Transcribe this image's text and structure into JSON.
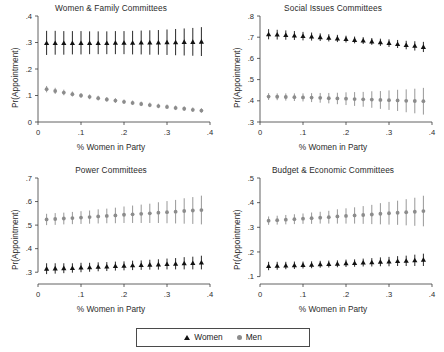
{
  "figure": {
    "legend": {
      "women_label": "Women",
      "men_label": "Men",
      "women_marker": "triangle-marker",
      "men_marker": "circle-marker",
      "women_color": "#111111",
      "men_color": "#8c8c8c"
    }
  },
  "chart_data": [
    {
      "type": "scatter",
      "title": "Women & Family Committees",
      "xlabel": "% Women in Party",
      "ylabel": "Pr(Appointment)",
      "xlim": [
        0,
        0.4
      ],
      "ylim": [
        0,
        0.4
      ],
      "xticks": [
        0,
        0.1,
        0.2,
        0.3,
        0.4
      ],
      "xticklabels": [
        "0",
        ".1",
        ".2",
        ".3",
        ".4"
      ],
      "yticks": [
        0,
        0.1,
        0.2,
        0.3,
        0.4
      ],
      "yticklabels": [
        "0",
        ".1",
        ".2",
        ".3",
        ".4"
      ],
      "grid": false,
      "x": [
        0.02,
        0.04,
        0.06,
        0.08,
        0.1,
        0.12,
        0.14,
        0.16,
        0.18,
        0.2,
        0.22,
        0.24,
        0.26,
        0.28,
        0.3,
        0.32,
        0.34,
        0.36,
        0.38
      ],
      "series": [
        {
          "name": "Women",
          "marker": "triangle",
          "color": "#111111",
          "values": [
            0.298,
            0.298,
            0.298,
            0.298,
            0.298,
            0.298,
            0.298,
            0.298,
            0.299,
            0.299,
            0.299,
            0.3,
            0.3,
            0.3,
            0.301,
            0.301,
            0.302,
            0.302,
            0.303
          ],
          "ci_low": [
            0.253,
            0.254,
            0.254,
            0.255,
            0.255,
            0.256,
            0.256,
            0.256,
            0.256,
            0.256,
            0.255,
            0.255,
            0.254,
            0.254,
            0.253,
            0.252,
            0.251,
            0.25,
            0.249
          ],
          "ci_high": [
            0.344,
            0.344,
            0.343,
            0.343,
            0.343,
            0.342,
            0.342,
            0.342,
            0.343,
            0.343,
            0.344,
            0.345,
            0.346,
            0.347,
            0.349,
            0.351,
            0.353,
            0.355,
            0.358
          ]
        },
        {
          "name": "Men",
          "marker": "circle",
          "color": "#8c8c8c",
          "values": [
            0.124,
            0.117,
            0.111,
            0.105,
            0.1,
            0.095,
            0.09,
            0.085,
            0.081,
            0.076,
            0.072,
            0.068,
            0.064,
            0.06,
            0.057,
            0.053,
            0.05,
            0.046,
            0.043
          ],
          "ci_low": [
            0.112,
            0.106,
            0.101,
            0.096,
            0.091,
            0.086,
            0.081,
            0.077,
            0.072,
            0.068,
            0.064,
            0.06,
            0.056,
            0.052,
            0.049,
            0.045,
            0.042,
            0.038,
            0.035
          ],
          "ci_high": [
            0.136,
            0.129,
            0.122,
            0.115,
            0.109,
            0.104,
            0.099,
            0.094,
            0.09,
            0.085,
            0.081,
            0.077,
            0.073,
            0.069,
            0.066,
            0.062,
            0.059,
            0.055,
            0.052
          ]
        }
      ]
    },
    {
      "type": "scatter",
      "title": "Social Issues Committees",
      "xlabel": "% Women in Party",
      "ylabel": "Pr(Appointment)",
      "xlim": [
        0,
        0.4
      ],
      "ylim": [
        0.3,
        0.8
      ],
      "xticks": [
        0,
        0.1,
        0.2,
        0.3,
        0.4
      ],
      "xticklabels": [
        "0",
        ".1",
        ".2",
        ".3",
        ".4"
      ],
      "yticks": [
        0.3,
        0.4,
        0.5,
        0.6,
        0.7,
        0.8
      ],
      "yticklabels": [
        ".3",
        ".4",
        ".5",
        ".6",
        ".7",
        ".8"
      ],
      "grid": false,
      "x": [
        0.02,
        0.04,
        0.06,
        0.08,
        0.1,
        0.12,
        0.14,
        0.16,
        0.18,
        0.2,
        0.22,
        0.24,
        0.26,
        0.28,
        0.3,
        0.32,
        0.34,
        0.36,
        0.38
      ],
      "series": [
        {
          "name": "Women",
          "marker": "triangle",
          "color": "#111111",
          "values": [
            0.714,
            0.712,
            0.71,
            0.708,
            0.705,
            0.703,
            0.7,
            0.697,
            0.694,
            0.691,
            0.687,
            0.684,
            0.68,
            0.676,
            0.672,
            0.668,
            0.663,
            0.659,
            0.654
          ],
          "ci_low": [
            0.69,
            0.689,
            0.688,
            0.687,
            0.685,
            0.684,
            0.682,
            0.68,
            0.677,
            0.675,
            0.671,
            0.668,
            0.664,
            0.659,
            0.654,
            0.649,
            0.643,
            0.637,
            0.63
          ],
          "ci_high": [
            0.738,
            0.735,
            0.732,
            0.729,
            0.725,
            0.722,
            0.718,
            0.714,
            0.711,
            0.707,
            0.703,
            0.7,
            0.696,
            0.693,
            0.69,
            0.687,
            0.683,
            0.681,
            0.678
          ]
        },
        {
          "name": "Men",
          "marker": "circle",
          "color": "#8c8c8c",
          "values": [
            0.42,
            0.419,
            0.418,
            0.417,
            0.416,
            0.415,
            0.414,
            0.412,
            0.411,
            0.41,
            0.408,
            0.407,
            0.406,
            0.404,
            0.403,
            0.402,
            0.4,
            0.399,
            0.398
          ],
          "ci_low": [
            0.404,
            0.403,
            0.401,
            0.399,
            0.397,
            0.394,
            0.391,
            0.388,
            0.384,
            0.38,
            0.376,
            0.372,
            0.367,
            0.362,
            0.357,
            0.352,
            0.346,
            0.341,
            0.335
          ],
          "ci_high": [
            0.436,
            0.435,
            0.435,
            0.435,
            0.435,
            0.436,
            0.437,
            0.437,
            0.438,
            0.44,
            0.441,
            0.442,
            0.445,
            0.446,
            0.449,
            0.452,
            0.454,
            0.457,
            0.461
          ]
        }
      ]
    },
    {
      "type": "scatter",
      "title": "Power Committees",
      "xlabel": "% Women in Party",
      "ylabel": "Pr(Appointment)",
      "xlim": [
        0,
        0.4
      ],
      "ylim": [
        0.25,
        0.7
      ],
      "xticks": [
        0,
        0.1,
        0.2,
        0.3,
        0.4
      ],
      "xticklabels": [
        "0",
        ".1",
        ".2",
        ".3",
        ".4"
      ],
      "yticks": [
        0.3,
        0.4,
        0.5,
        0.6,
        0.7
      ],
      "yticklabels": [
        ".3",
        ".4",
        ".5",
        ".6",
        ".7"
      ],
      "grid": false,
      "x": [
        0.02,
        0.04,
        0.06,
        0.08,
        0.1,
        0.12,
        0.14,
        0.16,
        0.18,
        0.2,
        0.22,
        0.24,
        0.26,
        0.28,
        0.3,
        0.32,
        0.34,
        0.36,
        0.38
      ],
      "series": [
        {
          "name": "Women",
          "marker": "triangle",
          "color": "#111111",
          "values": [
            0.315,
            0.316,
            0.317,
            0.318,
            0.32,
            0.321,
            0.323,
            0.324,
            0.326,
            0.327,
            0.329,
            0.33,
            0.332,
            0.333,
            0.335,
            0.336,
            0.338,
            0.339,
            0.341
          ],
          "ci_low": [
            0.292,
            0.294,
            0.296,
            0.298,
            0.3,
            0.302,
            0.304,
            0.305,
            0.307,
            0.308,
            0.309,
            0.31,
            0.311,
            0.311,
            0.312,
            0.312,
            0.312,
            0.312,
            0.312
          ],
          "ci_high": [
            0.338,
            0.338,
            0.338,
            0.338,
            0.34,
            0.34,
            0.342,
            0.343,
            0.345,
            0.346,
            0.349,
            0.35,
            0.353,
            0.355,
            0.358,
            0.36,
            0.364,
            0.366,
            0.37
          ]
        },
        {
          "name": "Men",
          "marker": "circle",
          "color": "#8c8c8c",
          "values": [
            0.524,
            0.526,
            0.528,
            0.53,
            0.532,
            0.534,
            0.537,
            0.539,
            0.541,
            0.544,
            0.546,
            0.548,
            0.55,
            0.553,
            0.555,
            0.557,
            0.56,
            0.562,
            0.564
          ],
          "ci_low": [
            0.5,
            0.501,
            0.503,
            0.504,
            0.505,
            0.506,
            0.507,
            0.508,
            0.508,
            0.509,
            0.509,
            0.509,
            0.509,
            0.509,
            0.508,
            0.507,
            0.506,
            0.505,
            0.503
          ],
          "ci_high": [
            0.548,
            0.551,
            0.553,
            0.556,
            0.559,
            0.562,
            0.567,
            0.57,
            0.574,
            0.579,
            0.583,
            0.587,
            0.591,
            0.597,
            0.602,
            0.607,
            0.614,
            0.619,
            0.625
          ]
        }
      ]
    },
    {
      "type": "scatter",
      "title": "Budget & Economic Committees",
      "xlabel": "% Women in Party",
      "ylabel": "Pr(Appointment)",
      "xlim": [
        0,
        0.4
      ],
      "ylim": [
        0.07,
        0.5
      ],
      "xticks": [
        0,
        0.1,
        0.2,
        0.3,
        0.4
      ],
      "xticklabels": [
        "0",
        ".1",
        ".2",
        ".3",
        ".4"
      ],
      "yticks": [
        0.1,
        0.2,
        0.3,
        0.4,
        0.5
      ],
      "yticklabels": [
        ".1",
        ".2",
        ".3",
        ".4",
        ".5"
      ],
      "grid": false,
      "x": [
        0.02,
        0.04,
        0.06,
        0.08,
        0.1,
        0.12,
        0.14,
        0.16,
        0.18,
        0.2,
        0.22,
        0.24,
        0.26,
        0.28,
        0.3,
        0.32,
        0.34,
        0.36,
        0.38
      ],
      "series": [
        {
          "name": "Women",
          "marker": "triangle",
          "color": "#111111",
          "values": [
            0.143,
            0.144,
            0.145,
            0.146,
            0.147,
            0.148,
            0.15,
            0.151,
            0.152,
            0.154,
            0.155,
            0.157,
            0.158,
            0.16,
            0.161,
            0.163,
            0.164,
            0.166,
            0.168
          ],
          "ci_low": [
            0.126,
            0.128,
            0.13,
            0.131,
            0.133,
            0.134,
            0.136,
            0.137,
            0.138,
            0.139,
            0.14,
            0.141,
            0.141,
            0.142,
            0.142,
            0.143,
            0.143,
            0.143,
            0.143
          ],
          "ci_high": [
            0.16,
            0.16,
            0.16,
            0.161,
            0.161,
            0.162,
            0.164,
            0.165,
            0.166,
            0.169,
            0.17,
            0.173,
            0.175,
            0.178,
            0.18,
            0.183,
            0.185,
            0.189,
            0.193
          ]
        },
        {
          "name": "Men",
          "marker": "circle",
          "color": "#8c8c8c",
          "values": [
            0.327,
            0.329,
            0.331,
            0.333,
            0.335,
            0.337,
            0.339,
            0.341,
            0.344,
            0.346,
            0.348,
            0.35,
            0.352,
            0.355,
            0.357,
            0.359,
            0.361,
            0.363,
            0.366
          ],
          "ci_low": [
            0.31,
            0.311,
            0.312,
            0.313,
            0.314,
            0.314,
            0.315,
            0.315,
            0.315,
            0.315,
            0.315,
            0.314,
            0.313,
            0.312,
            0.311,
            0.31,
            0.308,
            0.306,
            0.304
          ],
          "ci_high": [
            0.344,
            0.347,
            0.35,
            0.353,
            0.356,
            0.36,
            0.363,
            0.367,
            0.373,
            0.377,
            0.381,
            0.386,
            0.391,
            0.398,
            0.403,
            0.408,
            0.414,
            0.42,
            0.428
          ]
        }
      ]
    }
  ]
}
